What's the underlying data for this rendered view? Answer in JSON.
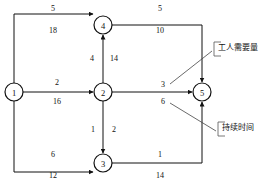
{
  "diagram": {
    "type": "activity-network",
    "nodes": [
      {
        "id": "n1",
        "label": "1",
        "x": 14,
        "y": 92
      },
      {
        "id": "n2",
        "label": "2",
        "x": 103,
        "y": 92
      },
      {
        "id": "n3",
        "label": "3",
        "x": 103,
        "y": 163
      },
      {
        "id": "n4",
        "label": "4",
        "x": 103,
        "y": 25
      },
      {
        "id": "n5",
        "label": "5",
        "x": 202,
        "y": 92
      }
    ],
    "edges": [
      {
        "id": "e14",
        "from": "1",
        "to": "4",
        "workers": "5",
        "duration": "18"
      },
      {
        "id": "e12",
        "from": "1",
        "to": "2",
        "workers": "2",
        "duration": "16"
      },
      {
        "id": "e13",
        "from": "1",
        "to": "3",
        "workers": "6",
        "duration": "12"
      },
      {
        "id": "e24",
        "from": "2",
        "to": "4",
        "workers": "4",
        "duration": "14"
      },
      {
        "id": "e23",
        "from": "2",
        "to": "3",
        "workers": "1",
        "duration": "2"
      },
      {
        "id": "e25",
        "from": "2",
        "to": "5",
        "workers": "3",
        "duration": "6"
      },
      {
        "id": "e45",
        "from": "4",
        "to": "5",
        "workers": "5",
        "duration": "10"
      },
      {
        "id": "e35",
        "from": "3",
        "to": "5",
        "workers": "1",
        "duration": "14"
      }
    ],
    "labels": {
      "e14_workers": {
        "text": "5",
        "x": 53,
        "y": 8
      },
      "e14_duration": {
        "text": "18",
        "x": 53,
        "y": 30
      },
      "e12_workers": {
        "text": "2",
        "x": 57,
        "y": 82
      },
      "e12_duration": {
        "text": "16",
        "x": 57,
        "y": 101
      },
      "e13_workers": {
        "text": "6",
        "x": 53,
        "y": 154
      },
      "e13_duration": {
        "text": "12",
        "x": 53,
        "y": 175
      },
      "e24_workers": {
        "text": "4",
        "x": 92,
        "y": 58
      },
      "e24_duration": {
        "text": "14",
        "x": 114,
        "y": 58
      },
      "e23_workers": {
        "text": "1",
        "x": 93,
        "y": 129
      },
      "e23_duration": {
        "text": "2",
        "x": 114,
        "y": 129
      },
      "e25_workers": {
        "text": "3",
        "x": 163,
        "y": 84
      },
      "e25_duration": {
        "text": "6",
        "x": 163,
        "y": 101
      },
      "e45_workers": {
        "text": "5",
        "x": 160,
        "y": 8
      },
      "e45_duration": {
        "text": "10",
        "x": 160,
        "y": 30
      },
      "e35_workers": {
        "text": "1",
        "x": 160,
        "y": 154
      },
      "e35_duration": {
        "text": "14",
        "x": 160,
        "y": 175
      }
    },
    "callouts": {
      "worker_requirement": {
        "text": "工人需要量",
        "points_to_label": "3"
      },
      "duration": {
        "text": "持续时间",
        "points_to_label": "6"
      }
    },
    "colors": {
      "stroke": "#111111",
      "node_fill": "#ffffff",
      "callout": "#555555",
      "background": "#ffffff"
    }
  }
}
